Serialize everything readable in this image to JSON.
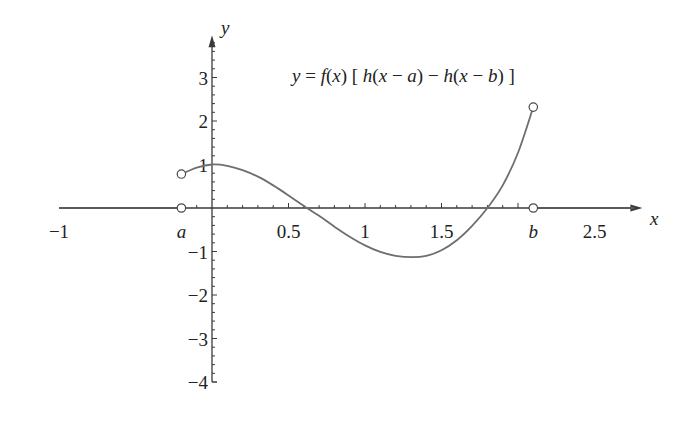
{
  "chart_data": {
    "type": "line",
    "title": "y = f(x) [ h(x − a) − h(x − b) ]",
    "xlabel": "x",
    "ylabel": "y",
    "xlim": [
      -1,
      2.8
    ],
    "ylim": [
      -4,
      3.9
    ],
    "grid": false,
    "x_tick_labels": [
      {
        "x": -1,
        "label": "−1"
      },
      {
        "x": -0.2,
        "label": "a",
        "italic": true
      },
      {
        "x": 0.5,
        "label": "0.5"
      },
      {
        "x": 1,
        "label": "1"
      },
      {
        "x": 1.5,
        "label": "1.5"
      },
      {
        "x": 2.1,
        "label": "b",
        "italic": true
      },
      {
        "x": 2.5,
        "label": "2.5"
      }
    ],
    "y_tick_labels": [
      {
        "y": 3,
        "label": "3"
      },
      {
        "y": 2,
        "label": "2"
      },
      {
        "y": 1,
        "label": "1"
      },
      {
        "y": -1,
        "label": "−1"
      },
      {
        "y": -2,
        "label": "−2"
      },
      {
        "y": -3,
        "label": "−3"
      },
      {
        "y": -4,
        "label": "−4"
      }
    ],
    "params": {
      "a": -0.2,
      "b": 2.1
    },
    "series": [
      {
        "name": "f(x) on (a, b)",
        "x": [
          -0.2,
          -0.1,
          0.0,
          0.1,
          0.2,
          0.3,
          0.4,
          0.5,
          0.62,
          0.7,
          0.8,
          0.9,
          1.0,
          1.1,
          1.2,
          1.31,
          1.4,
          1.5,
          1.6,
          1.7,
          1.8,
          1.9,
          2.0,
          2.1
        ],
        "y": [
          0.78,
          0.93,
          1.0,
          0.97,
          0.87,
          0.72,
          0.52,
          0.29,
          0.0,
          -0.18,
          -0.43,
          -0.66,
          -0.86,
          -1.01,
          -1.1,
          -1.13,
          -1.1,
          -0.97,
          -0.74,
          -0.41,
          0.0,
          0.52,
          1.27,
          2.32
        ]
      },
      {
        "name": "zero left",
        "x": [
          -1,
          -0.2
        ],
        "y": [
          0,
          0
        ]
      },
      {
        "name": "zero right",
        "x": [
          2.1,
          2.8
        ],
        "y": [
          0,
          0
        ]
      }
    ],
    "open_points": [
      {
        "x": -0.2,
        "y": 0.78
      },
      {
        "x": -0.2,
        "y": 0
      },
      {
        "x": 2.1,
        "y": 2.32
      },
      {
        "x": 2.1,
        "y": 0
      }
    ],
    "annotations": [
      {
        "text": "y = f(x) [ h(x − a) − h(x − b) ]",
        "x": 1.15,
        "y": 3.0
      }
    ]
  },
  "labels": {
    "x_axis": "x",
    "y_axis": "y",
    "formula_parts": [
      "y",
      " = ",
      "f",
      "(",
      "x",
      ") [ ",
      "h",
      "(",
      "x",
      " − ",
      "a",
      ") − ",
      "h",
      "(",
      "x",
      " − ",
      "b",
      ") ]"
    ]
  }
}
